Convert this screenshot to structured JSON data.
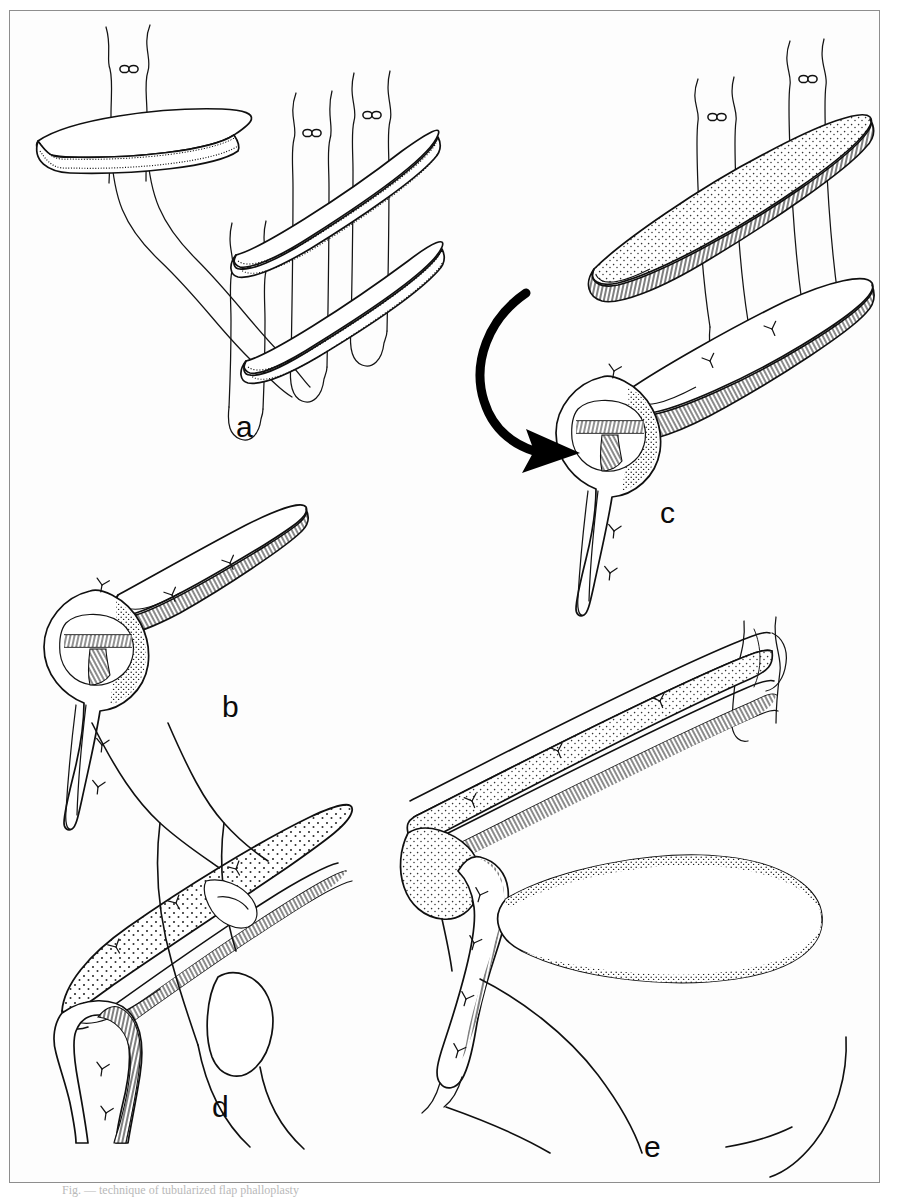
{
  "figure": {
    "kind": "medical-surgical-line-illustration",
    "background_color": "#fdfdfd",
    "ink_color": "#101010",
    "frame_color": "#8e8e8e",
    "page_width": 898,
    "page_height": 1198,
    "caption_partial_text": "Fig. — technique of tubularized flap phalloplasty"
  },
  "panels": [
    {
      "id": "a",
      "label": "a",
      "label_x": 236,
      "label_y": 412,
      "description": "Three harvested strap-like flaps with traction sutures passed through them; the upper-left flap is being transposed toward the paired parallel flaps at right."
    },
    {
      "id": "b",
      "label": "b",
      "label_x": 222,
      "label_y": 692,
      "description": "Close-up of the tubularized neourethral segment, its proximal funnel-shaped opening visible, with interrupted sutures along the shaft."
    },
    {
      "id": "c",
      "label": "c",
      "label_x": 660,
      "label_y": 498,
      "description": "Stippled flaps held on traction sutures; a curved rotation arrow indicates the direction in which the tubularized segment is rotated into position."
    },
    {
      "id": "d",
      "label": "d",
      "label_x": 212,
      "label_y": 1092,
      "description": "The outer stippled skin flap wrapped over the completed inner tube, sutured along the ventral aspect."
    },
    {
      "id": "e",
      "label": "e",
      "label_x": 644,
      "label_y": 1132,
      "description": "Sagittal view of the reconstructed phallus in situ, with the neourethra anastomosed proximally and the scrotum shown below."
    }
  ],
  "graphic_elements": {
    "suture_knot_icon": "suture-knot",
    "rotation_arrow_icon": "curved-rotation-arrow",
    "stitch_mark_icon": "interrupted-stitch",
    "stipple_texture": "dot-stipple-shading",
    "hatch_texture": "cut-edge-hatching"
  }
}
